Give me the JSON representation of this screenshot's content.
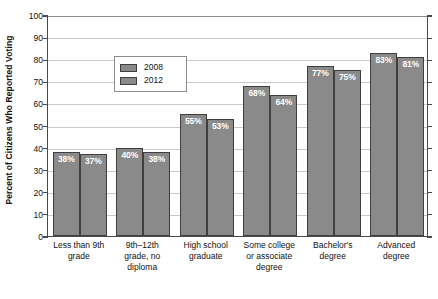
{
  "chart_data": {
    "type": "bar",
    "title": "",
    "xlabel": "",
    "ylabel": "Percent of Citizens Who Reported Voting",
    "ylim": [
      0,
      100
    ],
    "ytick_labels": [
      "0",
      "10",
      "20",
      "30",
      "40",
      "50",
      "60",
      "70",
      "80",
      "90",
      "100"
    ],
    "ytick_values": [
      0,
      10,
      20,
      30,
      40,
      50,
      60,
      70,
      80,
      90,
      100
    ],
    "grid": "horizontal",
    "legend_position": "upper-left-inside",
    "categories": [
      "Less than 9th grade",
      "9th–12th grade, no diploma",
      "High school graduate",
      "Some college or associate degree",
      "Bachelor's degree",
      "Advanced degree"
    ],
    "category_lines": [
      [
        "Less than 9th",
        "grade"
      ],
      [
        "9th–12th",
        "grade, no",
        "diploma"
      ],
      [
        "High school",
        "graduate"
      ],
      [
        "Some college",
        "or associate",
        "degree"
      ],
      [
        "Bachelor's",
        "degree"
      ],
      [
        "Advanced",
        "degree"
      ]
    ],
    "series": [
      {
        "name": "2008",
        "color": "#8a8a8a",
        "values": [
          38,
          40,
          55,
          68,
          77,
          83
        ],
        "data_labels": [
          "38%",
          "40%",
          "55%",
          "68%",
          "77%",
          "83%"
        ]
      },
      {
        "name": "2012",
        "color": "#8a8a8a",
        "values": [
          37,
          38,
          53,
          64,
          75,
          81
        ],
        "data_labels": [
          "37%",
          "38%",
          "53%",
          "64%",
          "75%",
          "81%"
        ]
      }
    ]
  },
  "legend": {
    "entries": [
      {
        "label": "2008",
        "color": "#8a8a8a"
      },
      {
        "label": "2012",
        "color": "#8a8a8a"
      }
    ]
  },
  "axis": {
    "y_title": "Percent of Citizens Who Reported Voting"
  },
  "colors": {
    "bar_fill": "#8a8a8a",
    "bar_stroke": "#3f3f3f",
    "gridline": "#c9c9c9",
    "axis_line": "#4a4a4a",
    "data_label_text": "#ffffff",
    "background": "#ffffff"
  }
}
